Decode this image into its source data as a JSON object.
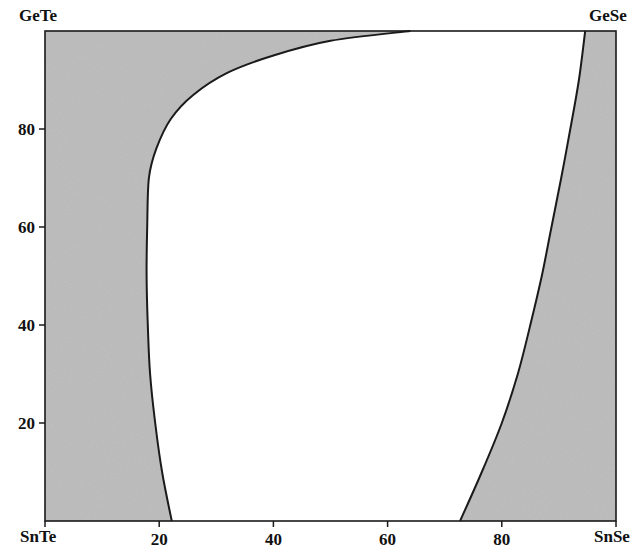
{
  "chart_data": {
    "type": "area",
    "title": "",
    "xlabel": "",
    "ylabel": "",
    "corner_labels": {
      "top_left": "GeTe",
      "top_right": "GeSe",
      "bottom_left": "SnTe",
      "bottom_right": "SnSe"
    },
    "xlim": [
      0,
      100
    ],
    "ylim": [
      0,
      100
    ],
    "x_ticks": [
      20,
      40,
      60,
      80
    ],
    "y_ticks": [
      20,
      40,
      60,
      80
    ],
    "x_tick_labels": [
      "20",
      "40",
      "60",
      "80"
    ],
    "y_tick_labels": [
      "20",
      "40",
      "60",
      "80"
    ],
    "grid": false,
    "legend": null,
    "fill_color": "#c0c0c0",
    "line_color": "#1a1a1a",
    "regions": [
      {
        "name": "shaded-left",
        "description": "gray region between SnTe–GeTe edge and left boundary"
      },
      {
        "name": "unshaded-center",
        "description": "white region between the two boundaries"
      },
      {
        "name": "shaded-right",
        "description": "gray region between right boundary and SnSe–GeSe edge"
      }
    ],
    "series": [
      {
        "name": "left-boundary",
        "x": [
          22.2,
          20.5,
          19.3,
          18.4,
          18.0,
          17.8,
          17.9,
          18.2,
          19.5,
          22.0,
          26.0,
          32.0,
          40.0,
          50.0,
          64.0
        ],
        "y": [
          0,
          10,
          20,
          30,
          40,
          50,
          60,
          70,
          76,
          82,
          87,
          91.5,
          95,
          98,
          100
        ]
      },
      {
        "name": "right-boundary",
        "x": [
          72.7,
          76.5,
          80.0,
          82.8,
          85.0,
          87.0,
          88.7,
          90.4,
          92.0,
          93.5,
          94.6
        ],
        "y": [
          0,
          10,
          20,
          30,
          40,
          50,
          60,
          70,
          80,
          90,
          100
        ]
      }
    ]
  }
}
